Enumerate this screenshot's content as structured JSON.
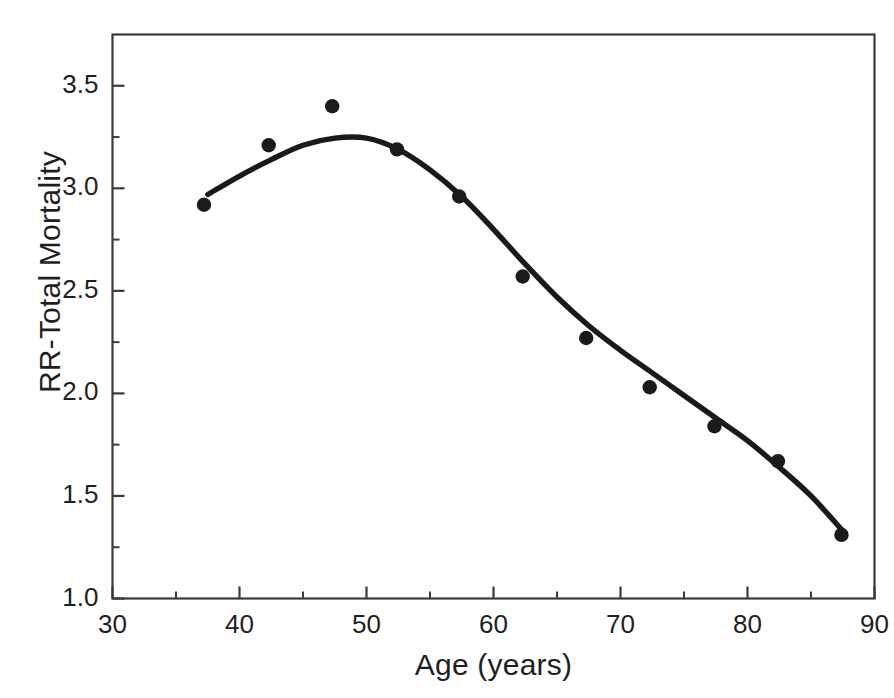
{
  "chart_data": {
    "type": "scatter",
    "title": "",
    "xlabel": "Age (years)",
    "ylabel": "RR-Total Mortality",
    "xlim": [
      30,
      90
    ],
    "ylim": [
      1.0,
      3.75
    ],
    "xticks": [
      30,
      40,
      50,
      60,
      70,
      80,
      90
    ],
    "xtick_labels": [
      "30",
      "40",
      "50",
      "60",
      "70",
      "80",
      "90"
    ],
    "x_minor_ticks": [
      35,
      45,
      55,
      65,
      75,
      85
    ],
    "yticks": [
      1.0,
      1.5,
      2.0,
      2.5,
      3.0,
      3.5
    ],
    "ytick_labels": [
      "1.0",
      "1.5",
      "2.0",
      "2.5",
      "3.0",
      "3.5"
    ],
    "y_minor_ticks": [
      1.25,
      1.75,
      2.25,
      2.75,
      3.25,
      3.75
    ],
    "grid": false,
    "legend": null,
    "marker_color": "#1a1a1a",
    "line_color": "#1a1a1a",
    "frame_color": "#3a3a3a",
    "background": "#ffffff",
    "series": [
      {
        "name": "Observed RR-Total Mortality",
        "type": "scatter",
        "x": [
          37.2,
          42.3,
          47.3,
          52.4,
          57.3,
          62.3,
          67.3,
          72.3,
          77.4,
          82.4,
          87.4
        ],
        "values": [
          2.92,
          3.21,
          3.4,
          3.19,
          2.96,
          2.57,
          2.27,
          2.03,
          1.84,
          1.67,
          1.31
        ]
      },
      {
        "name": "Fitted smooth curve",
        "type": "line",
        "x": [
          37.5,
          40.0,
          42.5,
          45.0,
          47.5,
          50.0,
          52.5,
          55.0,
          57.5,
          60.0,
          62.5,
          65.0,
          67.5,
          70.0,
          72.5,
          75.0,
          77.5,
          80.0,
          82.5,
          85.0,
          87.5
        ],
        "values": [
          2.97,
          3.06,
          3.14,
          3.21,
          3.245,
          3.245,
          3.19,
          3.09,
          2.96,
          2.8,
          2.63,
          2.47,
          2.33,
          2.21,
          2.1,
          1.99,
          1.88,
          1.77,
          1.64,
          1.5,
          1.33
        ]
      }
    ]
  },
  "axis": {
    "x_title": "Age (years)",
    "y_title": "RR-Total Mortality"
  }
}
